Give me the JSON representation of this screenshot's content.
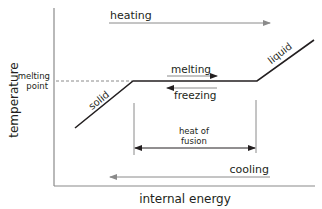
{
  "diagram": {
    "type": "heating-cooling curve",
    "axes": {
      "y_label": "temperature",
      "x_label": "internal energy"
    },
    "marker": {
      "melting_point_label_line1": "melting",
      "melting_point_label_line2": "point"
    },
    "segments": {
      "solid": "solid",
      "liquid": "liquid"
    },
    "arrows": {
      "heating": "heating",
      "cooling": "cooling",
      "melting": "melting",
      "freezing": "freezing",
      "heat_of_fusion_line1": "heat of",
      "heat_of_fusion_line2": "fusion"
    },
    "colors": {
      "curve": "#231f20",
      "axis": "#8a8a8a",
      "process_arrow": "#8a8a8a",
      "dashed_guide": "#8a8a8a"
    }
  }
}
